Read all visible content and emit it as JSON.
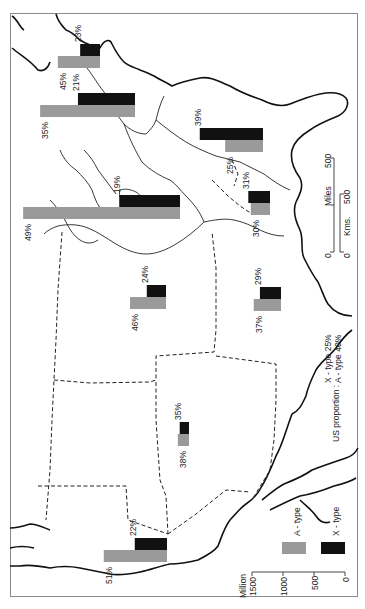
{
  "map": {
    "orientation": "rotated 90 degrees (north to the left)",
    "legend": {
      "unit_label": "Million",
      "axis_ticks": [
        "1500",
        "1000",
        "500",
        "0"
      ],
      "items": [
        {
          "label": "A - type",
          "color": "#9a9a9a"
        },
        {
          "label": "X - type",
          "color": "#111111"
        }
      ]
    },
    "us_proportion": {
      "prefix": "US proportion :",
      "x_type": "X - type  25%",
      "a_type": "A - type  40%"
    },
    "scale_bar": {
      "miles_label": "Miles",
      "kms_label": "Kms.",
      "miles_ticks": [
        "0",
        "500"
      ],
      "kms_ticks": [
        "0",
        "500"
      ]
    },
    "colors": {
      "a_type": "#9a9a9a",
      "x_type": "#111111"
    }
  },
  "chart_data": {
    "type": "bar",
    "title": "",
    "ylabel": "Million",
    "ylim": [
      0,
      1500
    ],
    "series_names": [
      "X - type",
      "A - type"
    ],
    "legend_position": "bottom-right (rotated)",
    "regions": [
      {
        "id": "r1",
        "x_pct": "23%",
        "a_pct": "45%",
        "x_value": 320,
        "a_value": 680,
        "base_x": 100,
        "y": 44
      },
      {
        "id": "r2",
        "x_pct": "21%",
        "a_pct": "35%",
        "x_value": 920,
        "a_value": 1530,
        "base_x": 135,
        "y": 93
      },
      {
        "id": "r3",
        "x_pct": "39%",
        "a_pct": "25%",
        "x_value": 1020,
        "a_value": 610,
        "base_x": 263,
        "y": 128
      },
      {
        "id": "r4",
        "x_pct": "19%",
        "a_pct": "49%",
        "x_value": 980,
        "a_value": 2530,
        "base_x": 180,
        "y": 195
      },
      {
        "id": "r5",
        "x_pct": "31%",
        "a_pct": "30%",
        "x_value": 350,
        "a_value": 310,
        "base_x": 270,
        "y": 191
      },
      {
        "id": "r6",
        "x_pct": "24%",
        "a_pct": "46%",
        "x_value": 310,
        "a_value": 580,
        "base_x": 166,
        "y": 285
      },
      {
        "id": "r7",
        "x_pct": "29%",
        "a_pct": "37%",
        "x_value": 340,
        "a_value": 440,
        "base_x": 281,
        "y": 287
      },
      {
        "id": "r8",
        "x_pct": "35%",
        "a_pct": "38%",
        "x_value": 150,
        "a_value": 180,
        "base_x": 189,
        "y": 422
      },
      {
        "id": "r9",
        "x_pct": "22%",
        "a_pct": "51%",
        "x_value": 520,
        "a_value": 1020,
        "base_x": 167,
        "y": 538
      }
    ]
  }
}
